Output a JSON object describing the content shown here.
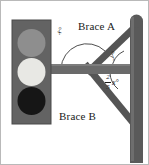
{
  "figure": {
    "border_color": "#b9b9b9",
    "background": "#ffffff"
  },
  "structure": {
    "pole": {
      "name": "vertical-support-pole",
      "color": "#5a5a5a",
      "x": 129,
      "top": 14,
      "bottom": 160,
      "width": 13
    },
    "arm": {
      "name": "horizontal-arm",
      "color": "#6a6a6a",
      "left": 44,
      "right": 132,
      "top": 63,
      "height": 10
    },
    "brace_a": {
      "name": "brace-a",
      "color": "#555555",
      "from_x": 86,
      "from_y": 70,
      "to_x": 131,
      "to_y": 28
    },
    "brace_b": {
      "name": "brace-b",
      "color": "#555555",
      "from_x": 86,
      "from_y": 66,
      "to_x": 131,
      "to_y": 122
    }
  },
  "traffic_light": {
    "name": "traffic-light-housing",
    "housing_color": "#636363",
    "x": 11,
    "y": 19,
    "width": 39,
    "height": 104,
    "lights": [
      {
        "name": "top-light",
        "color": "#8e8e8e",
        "label": "red"
      },
      {
        "name": "middle-light",
        "color": "#e8e8e4",
        "label": "yellow"
      },
      {
        "name": "bottom-light",
        "color": "#161616",
        "label": "green"
      }
    ]
  },
  "labels": {
    "brace_a": "Brace A",
    "brace_b": "Brace B",
    "angle_x": "x°",
    "angle_y": "y°",
    "angle_fraction_numerator": "2",
    "angle_fraction_denominator": "5",
    "angle_fraction_variable": "x°"
  },
  "angle_arcs": {
    "large_arc": {
      "name": "angle-arc-x",
      "center_x": 86,
      "center_y": 68,
      "radius": 26,
      "label": "x°"
    },
    "upper_arc": {
      "name": "angle-arc-y",
      "center_x": 131,
      "center_y": 68,
      "radius": 22,
      "label": "y°"
    },
    "lower_arc": {
      "name": "angle-arc-fraction-x",
      "center_x": 131,
      "center_y": 68,
      "radius": 24,
      "label": "2/5 x°"
    }
  }
}
